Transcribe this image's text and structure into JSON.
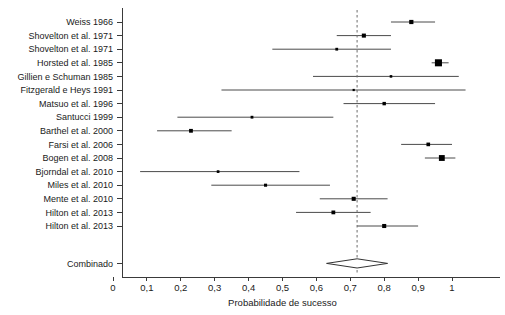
{
  "chart_data": {
    "type": "forest",
    "title": "",
    "xlabel": "Probabilidade de sucesso",
    "ylabel": "",
    "xlim": [
      0,
      1.13
    ],
    "xticks": [
      0,
      0.1,
      0.2,
      0.3,
      0.4,
      0.5,
      0.6,
      0.7,
      0.8,
      0.9,
      1
    ],
    "xticklabels": [
      "0",
      "0,1",
      "0,2",
      "0,3",
      "0,4",
      "0,5",
      "0,6",
      "0,7",
      "0,8",
      "0,9",
      "1"
    ],
    "grid": false,
    "legend": "none",
    "reference_line": {
      "value": 0.72,
      "style": "dashed",
      "label": "0,7"
    },
    "studies": [
      {
        "label": "Weiss 1966",
        "estimate": 0.88,
        "ci_low": 0.82,
        "ci_high": 0.95,
        "weight": 3.2
      },
      {
        "label": "Shovelton et al. 1971",
        "estimate": 0.74,
        "ci_low": 0.66,
        "ci_high": 0.82,
        "weight": 3.0
      },
      {
        "label": "Shovelton et al. 1971",
        "estimate": 0.66,
        "ci_low": 0.47,
        "ci_high": 0.82,
        "weight": 1.4
      },
      {
        "label": "Horsted et al. 1985",
        "estimate": 0.96,
        "ci_low": 0.94,
        "ci_high": 0.99,
        "weight": 9.0
      },
      {
        "label": "Gillien e Schuman 1985",
        "estimate": 0.82,
        "ci_low": 0.59,
        "ci_high": 1.02,
        "weight": 1.2
      },
      {
        "label": "Fitzgerald e Heys 1991",
        "estimate": 0.71,
        "ci_low": 0.32,
        "ci_high": 1.04,
        "weight": 0.9
      },
      {
        "label": "Matsuo et al. 1996",
        "estimate": 0.8,
        "ci_low": 0.68,
        "ci_high": 0.95,
        "weight": 2.1
      },
      {
        "label": "Santucci 1999",
        "estimate": 0.41,
        "ci_low": 0.19,
        "ci_high": 0.65,
        "weight": 1.4
      },
      {
        "label": "Barthel et al. 2000",
        "estimate": 0.23,
        "ci_low": 0.13,
        "ci_high": 0.35,
        "weight": 2.6
      },
      {
        "label": "Farsi et al. 2006",
        "estimate": 0.93,
        "ci_low": 0.85,
        "ci_high": 1.0,
        "weight": 2.4
      },
      {
        "label": "Bogen et al. 2008",
        "estimate": 0.97,
        "ci_low": 0.92,
        "ci_high": 1.01,
        "weight": 6.2
      },
      {
        "label": "Bjorndal et al. 2010",
        "estimate": 0.31,
        "ci_low": 0.08,
        "ci_high": 0.55,
        "weight": 1.3
      },
      {
        "label": "Miles et al. 2010",
        "estimate": 0.45,
        "ci_low": 0.29,
        "ci_high": 0.64,
        "weight": 1.7
      },
      {
        "label": "Mente et al. 2010",
        "estimate": 0.71,
        "ci_low": 0.61,
        "ci_high": 0.81,
        "weight": 3.0
      },
      {
        "label": "Hilton et al. 2013",
        "estimate": 0.65,
        "ci_low": 0.54,
        "ci_high": 0.76,
        "weight": 2.6
      },
      {
        "label": "Hilton et al. 2013",
        "estimate": 0.8,
        "ci_low": 0.72,
        "ci_high": 0.9,
        "weight": 3.0
      }
    ],
    "summary": {
      "label": "Combinado",
      "estimate": 0.72,
      "ci_low": 0.63,
      "ci_high": 0.81,
      "marker": "diamond"
    },
    "colors": {
      "marker": "#000000",
      "ci_line": "#4a4a4a",
      "axis": "#3a3a3a",
      "reference_line": "#6b6b6b",
      "text": "#1a1a1a",
      "background": "#ffffff"
    }
  }
}
